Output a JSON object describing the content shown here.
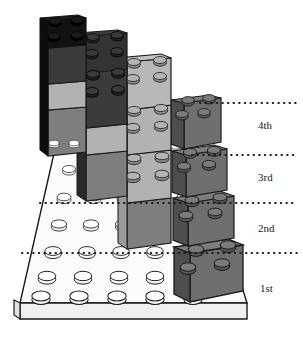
{
  "figure": {
    "type": "isometric-diagram",
    "background_color": "#ffffff",
    "outline_color": "#1a1a1a"
  },
  "palette": {
    "black": "#141414",
    "black_side": "#0d0d0d",
    "very_dark_gray": "#2e2e2e",
    "dark_gray": "#3f3f3f",
    "mid_dark_gray": "#555555",
    "mid_gray": "#7b7b7b",
    "gray": "#8c8c8c",
    "light_gray": "#a9a9a9",
    "lighter_gray": "#bdbdbd",
    "pale_gray": "#d2d2d2",
    "white": "#f7f7f4",
    "white_side": "#e6e6e2",
    "outline": "#1a1a1a"
  },
  "baseplate": {
    "name": "white-baseplate",
    "color": "#f7f7f4",
    "stud_rows": 6,
    "stud_cols": 6,
    "visible_stud_count": 30
  },
  "level_labels": [
    {
      "id": "lvl4",
      "text": "4th",
      "x": 258,
      "y": 125
    },
    {
      "id": "lvl3",
      "text": "3rd",
      "x": 258,
      "y": 177
    },
    {
      "id": "lvl2",
      "text": "2nd",
      "x": 258,
      "y": 228
    },
    {
      "id": "lvl1",
      "text": "1st",
      "x": 258,
      "y": 288
    }
  ],
  "leader_lines": [
    {
      "id": "line4",
      "label": "4th",
      "y": 103,
      "x_start": 200,
      "x_end": 297,
      "style": "dotted"
    },
    {
      "id": "line3",
      "label": "3rd",
      "y": 155,
      "x_start": 192,
      "x_end": 297,
      "style": "dotted"
    },
    {
      "id": "line2",
      "label": "2nd",
      "y": 203,
      "x_start": 40,
      "x_end": 297,
      "style": "dotted"
    },
    {
      "id": "line1",
      "label": "1st",
      "y": 253,
      "x_start": 22,
      "x_end": 297,
      "style": "dotted"
    }
  ],
  "stacks": [
    {
      "id": "stack-1",
      "position": "leftmost-tallest",
      "brick_count": 4,
      "bricks_top_to_bottom": [
        "black",
        "dark gray",
        "light gray",
        "mid gray"
      ]
    },
    {
      "id": "stack-2",
      "position": "second-from-left",
      "brick_count": 4,
      "bricks_top_to_bottom": [
        "very dark gray",
        "very dark gray",
        "light gray",
        "mid gray"
      ]
    },
    {
      "id": "stack-3",
      "position": "third-from-left",
      "brick_count": 4,
      "bricks_top_to_bottom": [
        "light gray",
        "light gray",
        "light gray",
        "mid gray"
      ]
    },
    {
      "id": "stack-4",
      "position": "rightmost",
      "brick_count": 4,
      "bricks_top_to_bottom": [
        "mid gray",
        "mid gray",
        "mid gray",
        "mid gray"
      ]
    }
  ]
}
